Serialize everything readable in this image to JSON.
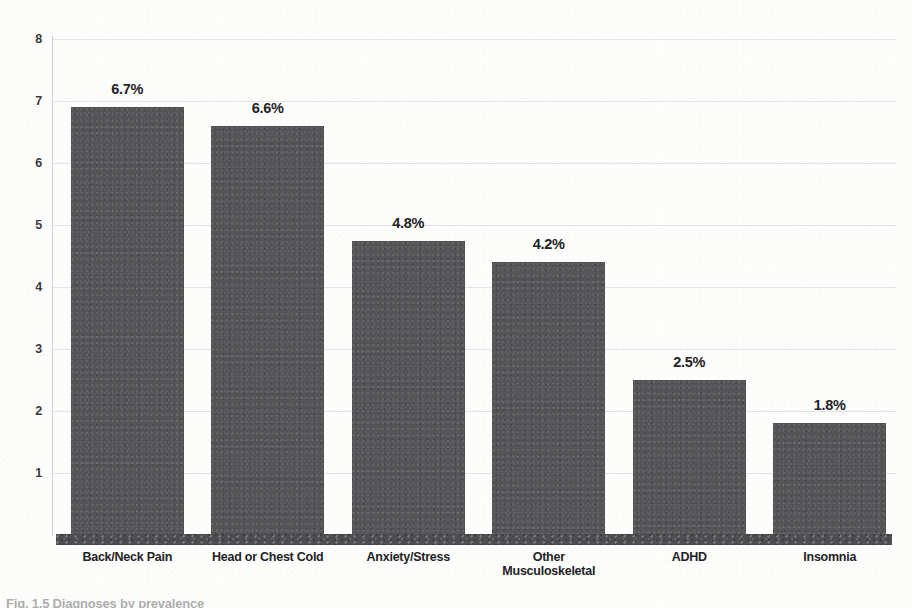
{
  "chart_data": {
    "type": "bar",
    "title": "",
    "subtitle": "",
    "xlabel": "",
    "ylabel": "",
    "ylim": [
      0,
      8
    ],
    "grid": true,
    "legend": "none",
    "orientation": "vertical",
    "bar_color": "#555558",
    "categories": [
      "Back/Neck Pain",
      "Head or Chest Cold",
      "Anxiety/Stress",
      "Other Musculoskeletal",
      "ADHD",
      "Insomnia"
    ],
    "category_lines": [
      [
        "Back/Neck Pain"
      ],
      [
        "Head or Chest Cold"
      ],
      [
        "Anxiety/Stress"
      ],
      [
        "Other",
        "Musculoskeletal"
      ],
      [
        "ADHD"
      ],
      [
        "Insomnia"
      ]
    ],
    "values": [
      6.9,
      6.6,
      4.75,
      4.4,
      2.5,
      1.8
    ],
    "data_labels": [
      "6.7%",
      "6.6%",
      "4.8%",
      "4.2%",
      "2.5%",
      "1.8%"
    ],
    "label_values": [
      6.7,
      6.6,
      4.8,
      4.2,
      2.5,
      1.8
    ],
    "yticks": [
      8,
      7,
      6,
      5,
      4,
      3,
      2,
      1
    ],
    "ytick_labels": [
      "8",
      "7",
      "6",
      "5",
      "4",
      "3",
      "2",
      "1"
    ]
  },
  "caption": {
    "text": "Fig. 1.5  Diagnoses by prevalence"
  }
}
